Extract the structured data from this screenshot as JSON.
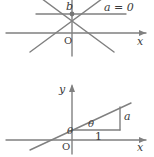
{
  "figure": {
    "title_visible": false,
    "background_color": "#ffffff",
    "line_color": "#808080",
    "text_color": "#3a3a3a",
    "width": 154,
    "height": 157
  },
  "diagram_top": {
    "name": "pencil-of-lines-through-b",
    "labels": {
      "b": "b",
      "origin": "O",
      "x_axis": "x",
      "condition": "a = 0"
    },
    "description_elements": {
      "y_axis": "vertical axis",
      "x_axis": "horizontal axis with right arrow",
      "intersection_point": "b on y-axis",
      "lines_through_point": 4
    }
  },
  "diagram_bottom": {
    "name": "line-with-slope-angle",
    "labels": {
      "y_axis": "y",
      "x_axis": "x",
      "origin": "O",
      "angle_upper": "θ",
      "angle_lower": "θ",
      "run": "1",
      "rise": "a"
    },
    "description_elements": {
      "slope_triangle": "right triangle with horizontal leg 1 and vertical leg a",
      "line": "line crossing y-axis above origin with inclination theta"
    }
  }
}
